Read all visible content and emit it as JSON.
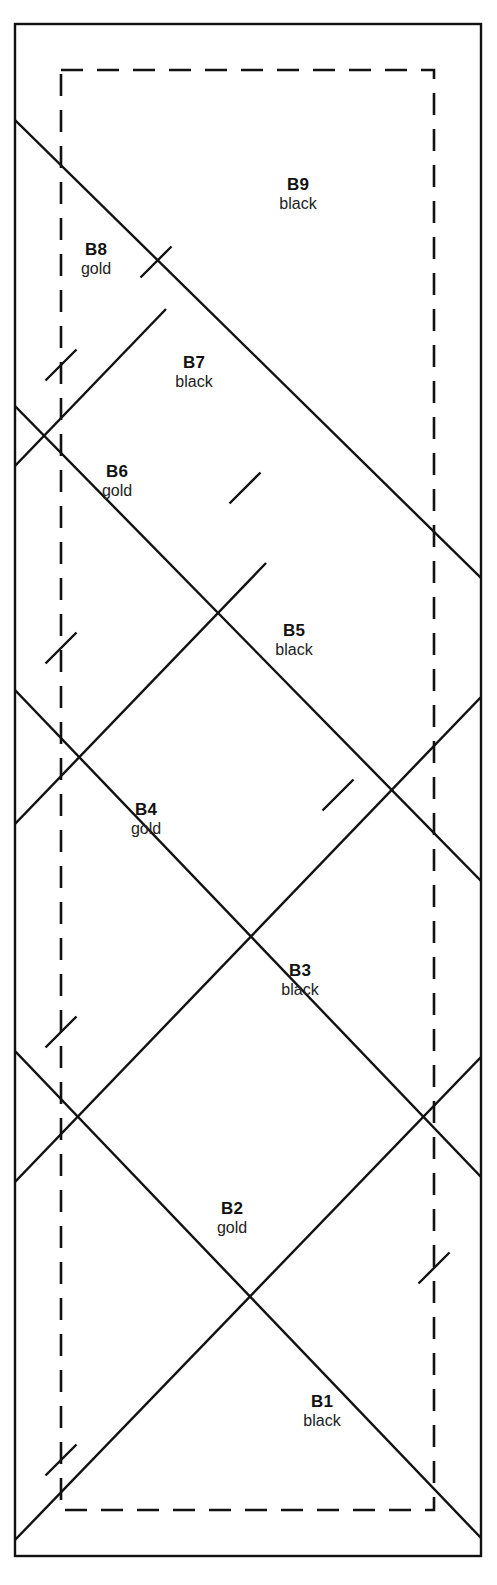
{
  "figure": {
    "kind": "technical-line-drawing",
    "background_color": "#ffffff",
    "line_color": "#111111",
    "outer_border": {
      "name": "fabric-edge",
      "style": "solid",
      "x1": 15,
      "y1": 24,
      "x2": 481,
      "y2": 1556,
      "stroke_width": 2.4
    },
    "inner_border": {
      "name": "cutting-guide",
      "style": "dashed",
      "x1": 61,
      "y1": 70,
      "x2": 434,
      "y2": 1510,
      "stroke_width": 2.6,
      "dash": "22 14"
    },
    "descending_lines": [
      {
        "x1": 15,
        "y1": 120,
        "x2": 481,
        "y2": 578
      },
      {
        "x1": 15,
        "y1": 406,
        "x2": 481,
        "y2": 881
      },
      {
        "x1": 15,
        "y1": 690,
        "x2": 481,
        "y2": 1177
      },
      {
        "x1": 15,
        "y1": 1051,
        "x2": 481,
        "y2": 1538
      }
    ],
    "ascending_lines": [
      {
        "x1": 15,
        "y1": 1540,
        "x2": 481,
        "y2": 1057
      },
      {
        "x1": 15,
        "y1": 1182,
        "x2": 481,
        "y2": 697
      },
      {
        "x1": 15,
        "y1": 824,
        "x2": 266,
        "y2": 563
      },
      {
        "x1": 15,
        "y1": 466,
        "x2": 166,
        "y2": 309
      }
    ],
    "intersection_marks": [
      {
        "x": 61,
        "y": 365,
        "label": "left-cross-1"
      },
      {
        "x": 61,
        "y": 648,
        "label": "left-cross-2"
      },
      {
        "x": 61,
        "y": 1032,
        "label": "left-cross-3"
      },
      {
        "x": 61,
        "y": 1460,
        "label": "left-cross-4"
      },
      {
        "x": 156,
        "y": 262,
        "label": "tick-cross-b8"
      },
      {
        "x": 245,
        "y": 488,
        "label": "tick-cross-b6"
      },
      {
        "x": 338,
        "y": 795,
        "label": "tick-cross-b4"
      },
      {
        "x": 434,
        "y": 1268,
        "label": "right-cross-1"
      }
    ],
    "bands": [
      {
        "id": "B1",
        "code": "B1",
        "color": "black",
        "label_x": 322,
        "label_y": 1393
      },
      {
        "id": "B2",
        "code": "B2",
        "color": "gold",
        "label_x": 232,
        "label_y": 1200
      },
      {
        "id": "B3",
        "code": "B3",
        "color": "black",
        "label_x": 300,
        "label_y": 962
      },
      {
        "id": "B4",
        "code": "B4",
        "color": "gold",
        "label_x": 146,
        "label_y": 801
      },
      {
        "id": "B5",
        "code": "B5",
        "color": "black",
        "label_x": 294,
        "label_y": 622
      },
      {
        "id": "B6",
        "code": "B6",
        "color": "gold",
        "label_x": 117,
        "label_y": 463
      },
      {
        "id": "B7",
        "code": "B7",
        "color": "black",
        "label_x": 194,
        "label_y": 354
      },
      {
        "id": "B8",
        "code": "B8",
        "color": "gold",
        "label_x": 96,
        "label_y": 241
      },
      {
        "id": "B9",
        "code": "B9",
        "color": "black",
        "label_x": 298,
        "label_y": 176
      }
    ]
  }
}
